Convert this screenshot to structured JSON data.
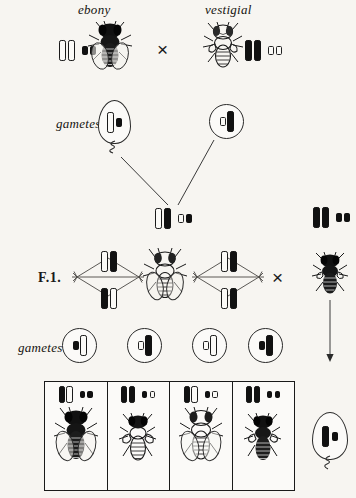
{
  "figure": {
    "domain": "genetics-diagram",
    "ink_color": "#111111",
    "paper_color": "#f7f5f1"
  },
  "parents": {
    "left_label": "ebony",
    "right_label": "vestigial",
    "cross_symbol": "×",
    "left_chromosomes": [
      "long-open",
      "long-open",
      "dot-filled",
      "dot-filled"
    ],
    "right_chromosomes": [
      "long-filled",
      "long-filled",
      "dot-open",
      "dot-open"
    ],
    "left_fly": "ebony-fly",
    "right_fly": "vestigial-fly"
  },
  "gametes_row1": {
    "label": "gametes",
    "egg_chromosomes": [
      "long-open",
      "dot-filled"
    ],
    "sperm_chromosomes": [
      "dot-open",
      "long-filled"
    ]
  },
  "zygote": {
    "chromosomes": [
      "long-open",
      "long-filled",
      "dot-open",
      "dot-filled"
    ]
  },
  "f1": {
    "label": "F.1.",
    "cross_symbol": "×",
    "left_spindle_top": [
      "long-open",
      "long-filled"
    ],
    "left_spindle_bottom": [
      "dot-filled",
      "dot-open"
    ],
    "right_spindle_top": [
      "long-open",
      "long-filled"
    ],
    "right_spindle_bottom": [
      "dot-open",
      "dot-filled"
    ],
    "fly": "wild-type-f1-fly"
  },
  "tester": {
    "chromosomes": [
      "long-filled",
      "long-filled",
      "dot-filled",
      "dot-filled"
    ],
    "fly": "ebony-vestigial-tester-fly",
    "egg_chromosomes": [
      "long-filled",
      "dot-filled"
    ],
    "egg_tail": "tail-squiggle"
  },
  "gametes_row2": {
    "label": "gametes",
    "cells": [
      {
        "chromosomes": [
          "dot-filled",
          "long-open"
        ]
      },
      {
        "chromosomes": [
          "dot-open",
          "long-filled"
        ]
      },
      {
        "chromosomes": [
          "dot-open",
          "long-open"
        ]
      },
      {
        "chromosomes": [
          "dot-filled",
          "long-filled"
        ]
      }
    ]
  },
  "offspring": {
    "cells": [
      {
        "chromosomes": [
          "long-filled",
          "long-open",
          "dot-filled",
          "dot-filled"
        ],
        "fly": "ebony-offspring-fly"
      },
      {
        "chromosomes": [
          "long-filled",
          "long-filled",
          "dot-filled",
          "dot-open"
        ],
        "fly": "ebony-vestigial-offspring-fly"
      },
      {
        "chromosomes": [
          "long-filled",
          "long-open",
          "dot-filled",
          "dot-open"
        ],
        "fly": "wild-type-offspring-fly"
      },
      {
        "chromosomes": [
          "long-filled",
          "long-filled",
          "dot-filled",
          "dot-filled"
        ],
        "fly": "vestigial-offspring-fly"
      }
    ]
  }
}
